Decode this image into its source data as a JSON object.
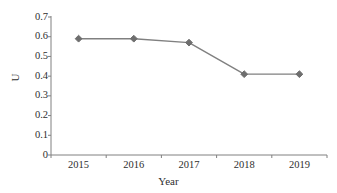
{
  "chart_data": {
    "type": "line",
    "title": "",
    "subtitle": "",
    "xlabel": "Year",
    "ylabel": "U",
    "categories": [
      "2015",
      "2016",
      "2017",
      "2018",
      "2019"
    ],
    "values": [
      0.59,
      0.59,
      0.57,
      0.41,
      0.41
    ],
    "series": [
      {
        "name": "U",
        "values": [
          0.59,
          0.59,
          0.57,
          0.41,
          0.41
        ]
      }
    ],
    "ylim": [
      0,
      0.7
    ],
    "ytick_labels": [
      "0.7",
      "0.6",
      "0.5",
      "0.4",
      "0.3",
      "0.2",
      "0.1",
      "0"
    ],
    "ytick_values": [
      0.7,
      0.6,
      0.5,
      0.4,
      0.3,
      0.2,
      0.1,
      0
    ],
    "ytick_step": 0.1,
    "xtick_labels": [
      "2015",
      "2016",
      "2017",
      "2018",
      "2019"
    ],
    "grid": false,
    "legend": false,
    "legend_position": "none",
    "marker": "diamond",
    "line_color": "#808080",
    "marker_color": "#6e6e6e",
    "axis_color": "#808080",
    "background_color": "#ffffff",
    "annotations": []
  },
  "axes": {
    "y_title": "U",
    "x_title": "Year"
  }
}
